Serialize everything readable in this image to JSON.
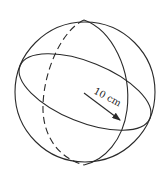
{
  "diagram": {
    "type": "sphere",
    "radius_label": "10 cm",
    "stroke_color": "#2a2a2a",
    "background": "#ffffff"
  }
}
